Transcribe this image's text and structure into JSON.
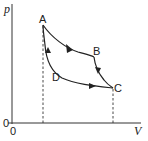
{
  "diagram": {
    "type": "p-V cycle",
    "axes": {
      "y_label": "p",
      "x_label": "V",
      "origin_y_label": "0",
      "origin_x_label": "0"
    },
    "points": [
      {
        "id": "A",
        "label": "A"
      },
      {
        "id": "B",
        "label": "B"
      },
      {
        "id": "C",
        "label": "C"
      },
      {
        "id": "D",
        "label": "D"
      }
    ],
    "paths": [
      {
        "from": "A",
        "to": "B",
        "direction": "A→B"
      },
      {
        "from": "B",
        "to": "C",
        "direction": "B→C"
      },
      {
        "from": "C",
        "to": "A",
        "via": "D",
        "direction": "C→D→A"
      }
    ],
    "colors": {
      "line": "#222222",
      "background": "#ffffff"
    }
  }
}
